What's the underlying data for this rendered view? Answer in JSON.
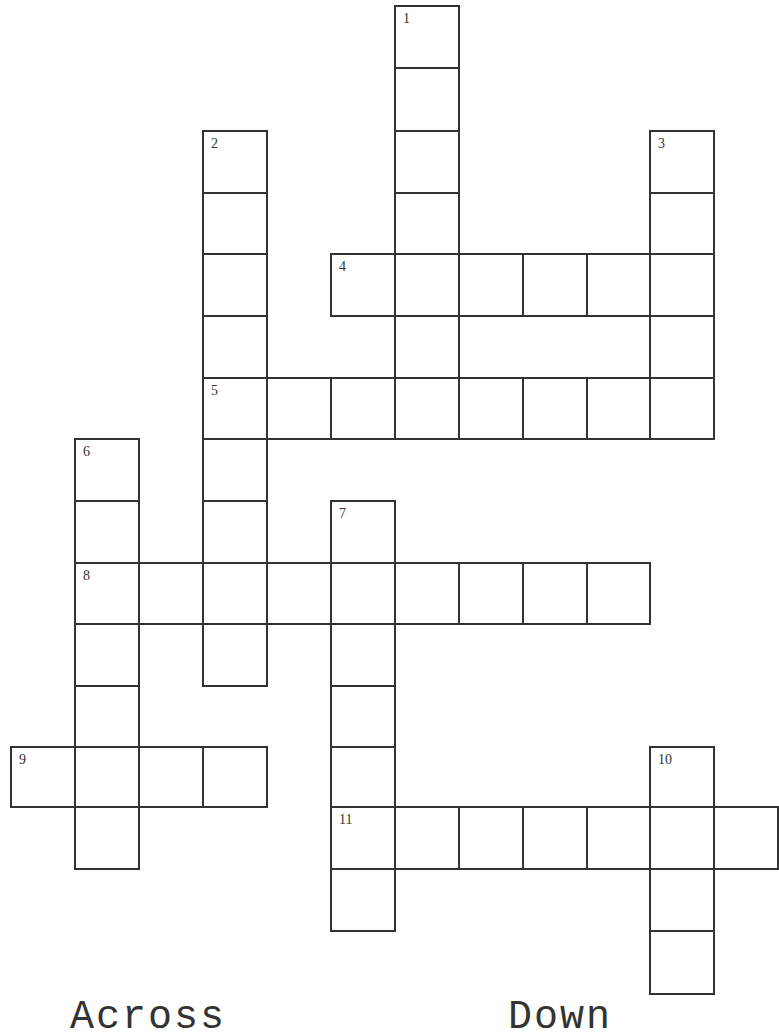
{
  "puzzle": {
    "grid": {
      "col_x": [
        10,
        74,
        138,
        202,
        266,
        330,
        394,
        458,
        522,
        586,
        649,
        713,
        777
      ],
      "row_y": [
        5,
        67,
        130,
        192,
        253,
        315,
        377,
        438,
        500,
        562,
        623,
        685,
        746,
        806,
        868,
        930,
        993
      ],
      "line_color": "#333333",
      "background": "#ffffff"
    },
    "entries": [
      {
        "number": "1",
        "direction": "down",
        "row": 0,
        "col": 6,
        "length": 7
      },
      {
        "number": "2",
        "direction": "down",
        "row": 2,
        "col": 3,
        "length": 9
      },
      {
        "number": "3",
        "direction": "down",
        "row": 2,
        "col": 10,
        "length": 5
      },
      {
        "number": "4",
        "direction": "across",
        "row": 4,
        "col": 5,
        "length": 6
      },
      {
        "number": "5",
        "direction": "across",
        "row": 6,
        "col": 3,
        "length": 8
      },
      {
        "number": "6",
        "direction": "down",
        "row": 7,
        "col": 1,
        "length": 7
      },
      {
        "number": "7",
        "direction": "down",
        "row": 8,
        "col": 5,
        "length": 7
      },
      {
        "number": "8",
        "direction": "across",
        "row": 9,
        "col": 1,
        "length": 9
      },
      {
        "number": "9",
        "direction": "across",
        "row": 12,
        "col": 0,
        "length": 4
      },
      {
        "number": "10",
        "direction": "down",
        "row": 12,
        "col": 10,
        "length": 4
      },
      {
        "number": "11",
        "direction": "across",
        "row": 13,
        "col": 5,
        "length": 7
      }
    ]
  },
  "headings": {
    "across": "Across",
    "down": "Down"
  }
}
